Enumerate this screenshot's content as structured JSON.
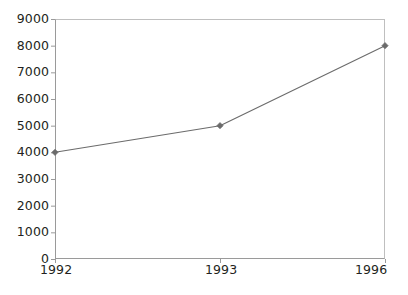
{
  "chart_data": {
    "type": "line",
    "title": "",
    "subtitle": "",
    "xlabel": "",
    "ylabel": "",
    "categories": [
      "1992",
      "1993",
      "1996"
    ],
    "values": [
      4000,
      5000,
      8000
    ],
    "series": [
      {
        "name": "",
        "values": [
          4000,
          5000,
          8000
        ]
      }
    ],
    "ylim": [
      0,
      9000
    ],
    "ytick_step": 1000,
    "ytick_labels": [
      "9000",
      "8000",
      "7000",
      "6000",
      "5000",
      "4000",
      "3000",
      "2000",
      "1000",
      "0"
    ],
    "ytick_values": [
      9000,
      8000,
      7000,
      6000,
      5000,
      4000,
      3000,
      2000,
      1000,
      0
    ],
    "xtick_labels": [
      "1992",
      "1993",
      "1996"
    ],
    "grid": false,
    "legend": false,
    "legend_position": "none",
    "annotations": [],
    "marker": "diamond",
    "line_color": "#6b6b6b",
    "marker_color": "#6b6b6b",
    "frame_color": "#9a9a9a",
    "text_color": "#231f20",
    "background_color": "#ffffff"
  }
}
